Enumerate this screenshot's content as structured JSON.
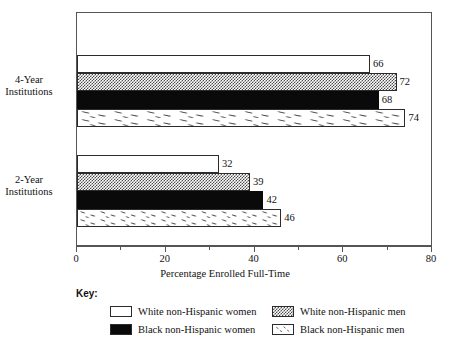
{
  "chart_data": {
    "type": "bar",
    "orientation": "horizontal",
    "title": "",
    "xlabel": "Percentage Enrolled Full-Time",
    "ylabel": "",
    "xlim": [
      0,
      80
    ],
    "xticks": [
      0,
      20,
      40,
      60,
      80
    ],
    "xtick_labels": [
      "0",
      "20",
      "40",
      "60",
      "80"
    ],
    "minor_tick_interval": 10,
    "grid": false,
    "legend_position": "below",
    "legend_title": "Key:",
    "categories": [
      "4-Year Institutions",
      "2-Year Institutions"
    ],
    "category_labels": [
      {
        "line1": "4-Year",
        "line2": "Institutions"
      },
      {
        "line1": "2-Year",
        "line2": "Institutions"
      }
    ],
    "series": [
      {
        "name": "White non-Hispanic women",
        "fill": "white",
        "values": [
          66,
          32
        ]
      },
      {
        "name": "White non-Hispanic men",
        "fill": "checkered",
        "values": [
          72,
          39
        ]
      },
      {
        "name": "Black non-Hispanic women",
        "fill": "solid-black",
        "values": [
          68,
          42
        ]
      },
      {
        "name": "Black non-Hispanic men",
        "fill": "speckled",
        "values": [
          74,
          46
        ]
      }
    ],
    "data_labels": [
      {
        "category": "4-Year Institutions",
        "series": "White non-Hispanic women",
        "value": "66"
      },
      {
        "category": "4-Year Institutions",
        "series": "White non-Hispanic men",
        "value": "72"
      },
      {
        "category": "4-Year Institutions",
        "series": "Black non-Hispanic women",
        "value": "68"
      },
      {
        "category": "4-Year Institutions",
        "series": "Black non-Hispanic men",
        "value": "74"
      },
      {
        "category": "2-Year Institutions",
        "series": "White non-Hispanic women",
        "value": "32"
      },
      {
        "category": "2-Year Institutions",
        "series": "White non-Hispanic men",
        "value": "39"
      },
      {
        "category": "2-Year Institutions",
        "series": "Black non-Hispanic women",
        "value": "42"
      },
      {
        "category": "2-Year Institutions",
        "series": "Black non-Hispanic men",
        "value": "46"
      }
    ]
  },
  "colors": {
    "frame": "#555555",
    "bar_outline": "#2b2b2b",
    "solid_black": "#0a0a0a",
    "pattern_gray": "#4a4a4a",
    "background": "#ffffff",
    "text": "#111111"
  },
  "legend": {
    "title": "Key:",
    "items": [
      {
        "label": "White non-Hispanic women",
        "fill": "white"
      },
      {
        "label": "White non-Hispanic men",
        "fill": "checkered"
      },
      {
        "label": "Black non-Hispanic women",
        "fill": "solid-black"
      },
      {
        "label": "Black non-Hispanic men",
        "fill": "speckled"
      }
    ]
  },
  "axis": {
    "x_label": "Percentage Enrolled Full-Time",
    "tick_labels": [
      "0",
      "20",
      "40",
      "60",
      "80"
    ]
  }
}
